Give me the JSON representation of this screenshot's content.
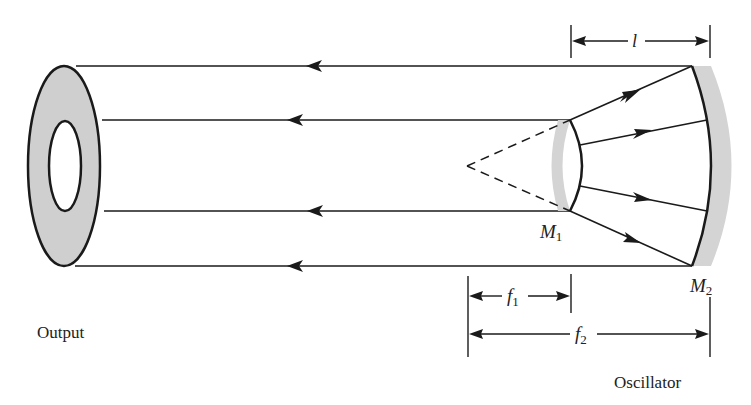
{
  "figure": {
    "labels": {
      "output": "Output",
      "oscillator": "Oscillator",
      "m1": "M",
      "m1_sub": "1",
      "m2": "M",
      "m2_sub": "2",
      "l": "l",
      "f1": "f",
      "f1_sub": "1",
      "f2": "f",
      "f2_sub": "2"
    },
    "colors": {
      "stroke": "#1a1a1a",
      "mirror_fill": "#d4d4d4",
      "annulus_fill": "#cfcfcf"
    }
  }
}
